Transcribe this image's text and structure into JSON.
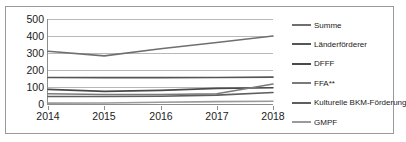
{
  "chart_data": {
    "type": "line",
    "title": "",
    "xlabel": "",
    "ylabel": "",
    "categories": [
      "2014",
      "2015",
      "2016",
      "2017",
      "2018"
    ],
    "x_tick_labels": [
      "2014",
      "2015",
      "2016",
      "2017",
      "2018"
    ],
    "y_tick_labels": [
      "500",
      "400",
      "300",
      "200",
      "100",
      "0"
    ],
    "y_ticks": [
      500,
      400,
      300,
      200,
      100,
      0
    ],
    "ylim": [
      0,
      500
    ],
    "grid": "horizontal",
    "legend_position": "right",
    "series": [
      {
        "name": "Summe",
        "label": "Summe",
        "color": "#6f6f6f",
        "values": [
          310,
          283,
          325,
          362,
          400
        ]
      },
      {
        "name": "Länderförderer",
        "label": "Länderförderer",
        "color": "#555555",
        "values": [
          156,
          155,
          155,
          156,
          158
        ]
      },
      {
        "name": "DFFF",
        "label": "DFFF",
        "color": "#4a4a4a",
        "values": [
          86,
          74,
          80,
          92,
          96
        ]
      },
      {
        "name": "FFA**",
        "label": "FFA**",
        "color": "#7a7a7a",
        "values": [
          60,
          56,
          56,
          60,
          118
        ]
      },
      {
        "name": "Kulturelle BKM-Förderung",
        "label": "Kulturelle BKM-Förderung",
        "color": "#5e5e5e",
        "values": [
          44,
          44,
          46,
          52,
          68
        ]
      },
      {
        "name": "GMPF",
        "label": "GMPF",
        "color": "#9a9a9a",
        "values": [
          5,
          6,
          10,
          14,
          16
        ]
      }
    ]
  },
  "legend": {
    "items": [
      {
        "label": "Summe"
      },
      {
        "label": "Länderförderer"
      },
      {
        "label": "DFFF"
      },
      {
        "label": "FFA**"
      },
      {
        "label": "Kulturelle BKM-Förderung"
      },
      {
        "label": "GMPF"
      }
    ]
  },
  "colors": {
    "frame": "#9a9a9a",
    "gridline": "#b8b8b8",
    "axis": "#8d8d8d",
    "text": "#1a1a1a",
    "background": "#ffffff"
  }
}
